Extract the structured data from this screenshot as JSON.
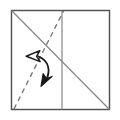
{
  "figure": {
    "kind": "origami-fold-diagram",
    "canvas": {
      "width": 120,
      "height": 120,
      "background": "#ffffff"
    },
    "colors": {
      "paper_outline": "#4d4d4d",
      "crease_solid": "#808080",
      "crease_dashed": "#707070",
      "arrow": "#1a1a1a",
      "paper_fill": "#ffffff"
    },
    "paper": {
      "shape": "square",
      "x": 11.5,
      "y": 10.5,
      "width": 98,
      "height": 99,
      "stroke_width": 1.4
    },
    "creases": [
      {
        "name": "diagonal-crease",
        "style": "solid",
        "from": [
          11.5,
          10.5
        ],
        "to": [
          109.5,
          109.5
        ],
        "stroke_width": 1.2
      },
      {
        "name": "vertical-crease",
        "style": "solid",
        "from": [
          62.0,
          10.5
        ],
        "to": [
          62.0,
          109.5
        ],
        "stroke_width": 1.2
      },
      {
        "name": "dashed-fold-line",
        "style": "dashed",
        "from": [
          14.0,
          109.0
        ],
        "to": [
          63.5,
          11.0
        ],
        "stroke_width": 1.3,
        "dash_pattern": "5 4"
      }
    ],
    "arrow": {
      "name": "fold-and-unfold-arrow",
      "type": "double-headed-curved",
      "path": "M 38.5 56.5 C 48.5 60.5 51.5 70.5 45.5 81.5",
      "stroke_width": 1.8,
      "head_start": {
        "name": "hollow-arrowhead",
        "fill": "none",
        "meaning": "unfold",
        "points": "26.5,56.0 39.5,51.0 36.5,56.5 39.5,62.0"
      },
      "head_end": {
        "name": "solid-arrowhead",
        "fill": "solid",
        "meaning": "fold",
        "points": "42.0,85.5 43.5,74.0 46.5,78.5 51.5,77.0"
      }
    },
    "labels": []
  }
}
